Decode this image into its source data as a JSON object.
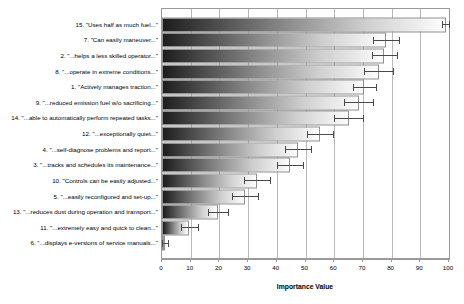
{
  "chart_data": {
    "type": "bar",
    "orientation": "horizontal",
    "title": "",
    "xlabel": "Importance Value",
    "ylabel": "",
    "xlim": [
      0,
      100
    ],
    "xticks": [
      0,
      10,
      20,
      30,
      40,
      50,
      60,
      70,
      80,
      90,
      100
    ],
    "grid": true,
    "grid_axis": "x",
    "legend": "none",
    "error_bars": "symmetric",
    "categories": [
      "15. \"Uses half as much fuel...\"",
      "7. \"Can easily maneuver...\"",
      "2. \"...helps a less skilled operator...\"",
      "8. \"...operate in extreme conditions...\"",
      "1. \"Actively manages traction...\"",
      "9. \"...reduced emission fuel w/o sacrificing...\"",
      "14. \"...able to automatically perform repeated tasks...\"",
      "12. \"...exceptionally quiet...\"",
      "4. \"...self-diagnose problems and report...\"",
      "3. \"...tracks and schedules its maintenance...\"",
      "10. \"Controls can be easily adjusted...\"",
      "5. \"...easily reconfigured and set-up...\"",
      "13. \"...reduces dust during operation and transport...\"",
      "11. \"...extremely easy and quick to clean...\"",
      "6. \"...displays e-versions of service manuals...\""
    ],
    "values": [
      99,
      78,
      77.5,
      75.5,
      70.5,
      68.5,
      65,
      55,
      47.5,
      44.5,
      33,
      29,
      19.5,
      9.5,
      1
    ],
    "errors": [
      1.5,
      4.5,
      4.5,
      5,
      4,
      5,
      5,
      4.5,
      4.5,
      4.5,
      4.5,
      4.5,
      3.5,
      3,
      1
    ],
    "bar_fill_gradient": [
      "#1d1d1d",
      "#ffffff"
    ],
    "bar_edge_color": "#8f8f8f",
    "error_bar_color": "#4a4a4a",
    "axis_color": "#9a9a9a",
    "grid_color": "#b9b9b9"
  }
}
